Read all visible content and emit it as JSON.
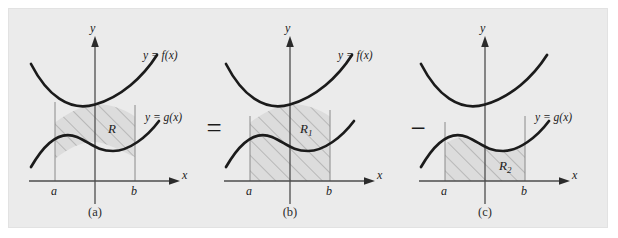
{
  "figure": {
    "background_color": "#ebebeb",
    "page_color": "#ffffff",
    "curve_color": "#1b1b1b",
    "axis_color": "#4d4d4d",
    "hatch_color": "#9a9a9a",
    "fill_color": "#dcdcdc",
    "border_color": "#e2e2e2"
  },
  "operators": {
    "equals": "=",
    "minus": "−"
  },
  "axis_labels": {
    "x": "x",
    "y": "y"
  },
  "tick_labels": {
    "a": "a",
    "b": "b"
  },
  "panels": [
    {
      "id": "a",
      "caption": "(a)",
      "region_label": "R",
      "curve_labels": [
        "y = f(x)",
        "y = g(x)"
      ],
      "shaded_description": "region between y = f(x) above and y = g(x) below, from x = a to x = b"
    },
    {
      "id": "b",
      "caption": "(b)",
      "region_label": "R₁",
      "region_label_base": "R",
      "region_label_sub": "1",
      "curve_labels": [
        "y = f(x)"
      ],
      "shaded_description": "region under y = f(x) down to the x-axis, from x = a to x = b"
    },
    {
      "id": "c",
      "caption": "(c)",
      "region_label": "R₂",
      "region_label_base": "R",
      "region_label_sub": "2",
      "curve_labels": [
        "y = g(x)"
      ],
      "shaded_description": "region under y = g(x) down to the x-axis, from x = a to x = b"
    }
  ]
}
